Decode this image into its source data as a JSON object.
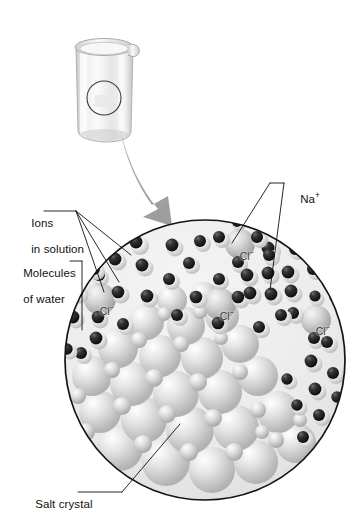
{
  "figure": {
    "type": "science-illustration",
    "background_color": "#ffffff",
    "line_color": "#111111",
    "arrow_color": "#a8a8a8",
    "solution_fill": "#ececec",
    "crystal_color": "#d9d9d9",
    "oxygen_color": "#2b2b2b",
    "hydrogen_color": "#f2f2f2",
    "chloride_color": "#cfcfcf"
  },
  "beaker": {
    "name": "beaker-of-salt-water",
    "glass_color": "#e2e2e2",
    "magnifier_circle": "magnified-region-indicator"
  },
  "zoom_arrow": {
    "name": "magnification-arrow",
    "direction": "down-right"
  },
  "callouts": [
    {
      "id": "ions-in-solution",
      "line1": "Ions",
      "line2": "in solution",
      "x": 18,
      "y": 206
    },
    {
      "id": "molecules-of-water",
      "line1": "Molecules",
      "line2": "of water",
      "x": 10,
      "y": 256
    },
    {
      "id": "sodium-ion",
      "line1": "Na",
      "sup": "+",
      "x": 277,
      "y": 176
    },
    {
      "id": "salt-crystal",
      "line1": "Salt crystal",
      "x": 22,
      "y": 486
    }
  ],
  "ion_labels": [
    {
      "id": "chloride-1",
      "text": "Cl",
      "sup": "−",
      "x": 228,
      "y": 236
    },
    {
      "id": "chloride-2",
      "text": "Cl",
      "sup": "−",
      "x": 88,
      "y": 291
    },
    {
      "id": "chloride-3",
      "text": "Cl",
      "sup": "−",
      "x": 208,
      "y": 296
    },
    {
      "id": "chloride-4",
      "text": "Cl",
      "sup": "−",
      "x": 304,
      "y": 311
    }
  ],
  "magnified_view": {
    "name": "magnified-solution-circle",
    "center_x": 205,
    "center_y": 360,
    "radius": 141
  }
}
